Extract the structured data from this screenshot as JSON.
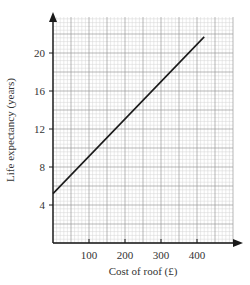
{
  "chart_data": {
    "type": "line",
    "title": "",
    "xlabel": "Cost of roof (£)",
    "ylabel": "Life expectancy (years)",
    "xlim": [
      0,
      440
    ],
    "ylim": [
      0,
      24
    ],
    "xticks": [
      100,
      200,
      300,
      400
    ],
    "yticks": [
      4,
      8,
      12,
      16,
      20
    ],
    "xtick_labels": [
      "100",
      "200",
      "300",
      "400"
    ],
    "ytick_labels": [
      "4",
      "8",
      "12",
      "16",
      "20"
    ],
    "grid": true,
    "legend": null,
    "series": [
      {
        "name": "Life expectancy",
        "x": [
          0,
          420
        ],
        "y": [
          5.2,
          21.7
        ]
      }
    ]
  },
  "colors": {
    "axis": "#1a1a1a",
    "line": "#1a1a1a",
    "grid_minor": "#d4d4d4",
    "grid_major": "#9a9a9a",
    "text": "#333333"
  }
}
